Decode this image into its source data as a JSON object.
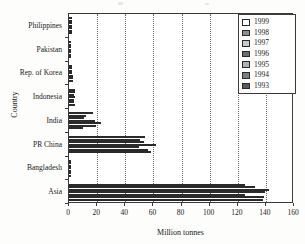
{
  "chart_data": {
    "type": "bar",
    "orientation": "horizontal",
    "title": "",
    "xlabel": "Million tonnes",
    "ylabel": "Country",
    "xlim": [
      0,
      160
    ],
    "xticks": [
      0,
      20,
      40,
      60,
      80,
      100,
      120,
      140,
      160
    ],
    "grid": "vertical-dotted",
    "legend_position": "top-right",
    "categories": [
      "Philippines",
      "Pakistan",
      "Rep. of Korea",
      "Indonesia",
      "India",
      "PR China",
      "Bangladesh",
      "Asia"
    ],
    "series": [
      {
        "name": "1999",
        "color": "#ffffff",
        "values": [
          2.1,
          1.4,
          2.3,
          4.6,
          17.2,
          54.0,
          1.5,
          125.5
        ]
      },
      {
        "name": "1998",
        "color": "#8f8f8f",
        "values": [
          2.0,
          1.3,
          2.2,
          4.2,
          11.8,
          50.5,
          1.4,
          132.5
        ]
      },
      {
        "name": "1997",
        "color": "#c9c9c9",
        "values": [
          2.0,
          1.3,
          2.1,
          3.9,
          11.0,
          53.0,
          1.3,
          142.0
        ]
      },
      {
        "name": "1996",
        "color": "#6e6e6e",
        "values": [
          2.1,
          1.2,
          2.4,
          4.0,
          18.5,
          62.0,
          1.3,
          139.5
        ]
      },
      {
        "name": "1995",
        "color": "#b0b0b0",
        "values": [
          2.2,
          1.2,
          2.5,
          3.6,
          23.0,
          49.5,
          1.2,
          125.0
        ]
      },
      {
        "name": "1994",
        "color": "#7d7d7d",
        "values": [
          2.1,
          1.1,
          2.6,
          3.4,
          19.2,
          56.5,
          1.2,
          138.5
        ]
      },
      {
        "name": "1993",
        "color": "#5a5a5a",
        "values": [
          2.0,
          1.1,
          2.5,
          4.4,
          10.2,
          58.0,
          1.1,
          138.0
        ]
      }
    ]
  },
  "legend": {
    "items": [
      {
        "label": "1999"
      },
      {
        "label": "1998"
      },
      {
        "label": "1997"
      },
      {
        "label": "1996"
      },
      {
        "label": "1995"
      },
      {
        "label": "1994"
      },
      {
        "label": "1993"
      }
    ]
  },
  "axes": {
    "x_title": "Million tonnes",
    "y_title": "Country"
  }
}
